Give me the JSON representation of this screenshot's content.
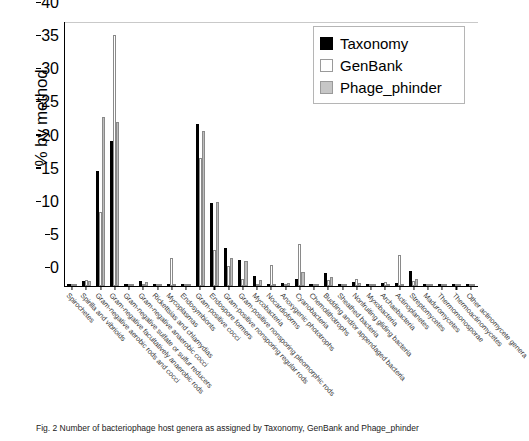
{
  "chart_data": {
    "type": "bar",
    "title": "",
    "xlabel": "",
    "ylabel": "% by method",
    "ylim": [
      0,
      40
    ],
    "yticks": [
      0,
      5,
      10,
      15,
      20,
      25,
      30,
      35,
      40
    ],
    "grid": false,
    "legend_position": "top-right",
    "colors": {
      "taxonomy": "#000000",
      "genbank": "#ffffff",
      "phage_phinder": "#bdbdbd"
    },
    "categories": [
      "Spirochetes",
      "Spirilla and vibrioids",
      "Gram-negative aerobic rods and cocci",
      "Gram-negative facultatively anaerobic rods",
      "Gram-negative sulfate or sulfur reducers",
      "Gram-negative anaerobic cocci",
      "Rickettsias and chlamydias",
      "Mycoplasmas",
      "Endosymbionts",
      "Gram-positive cocci",
      "Endospore formers",
      "Gram-positive nonsporing regular rods",
      "Gram-positive nonsporing pleomorphic rods",
      "Mycobacteria",
      "Nocardioforms",
      "Anoxygenic phototrophs",
      "Cyanobacteria",
      "Chemolithotrophs",
      "Budding and/or appendaged bacteria",
      "Sheathed bacteria",
      "Nonfruiting gliding bacteria",
      "Myxobacteria",
      "Archaebacteria",
      "Actinoplanetes",
      "Streptomycetes",
      "Maduromycetes",
      "Thermomonosporae",
      "Thermoactinomycetes",
      "Other actinomycete genera"
    ],
    "series": [
      {
        "name": "Taxonomy",
        "values": [
          0.3,
          0.8,
          17.4,
          21.9,
          0.0,
          0.8,
          0.1,
          0.0,
          0.0,
          24.5,
          12.5,
          5.7,
          3.9,
          1.5,
          0.0,
          0.5,
          1.1,
          0.2,
          1.9,
          0.0,
          0.6,
          0.0,
          0.5,
          0.4,
          2.2,
          0.0,
          0.2,
          0.0,
          0.2
        ],
        "color": "#000000"
      },
      {
        "name": "GenBank",
        "values": [
          0.2,
          0.9,
          11.2,
          37.9,
          0.1,
          0.0,
          0.0,
          4.2,
          0.2,
          19.3,
          5.5,
          3.0,
          1.1,
          0.3,
          3.2,
          0.1,
          6.4,
          0.0,
          0.9,
          0.0,
          1.0,
          0.1,
          0.6,
          4.7,
          0.7,
          0.0,
          0.3,
          0.0,
          0.2
        ],
        "color": "#ffffff"
      },
      {
        "name": "Phage_phinder",
        "values": [
          0.3,
          0.7,
          25.5,
          24.8,
          0.1,
          0.6,
          0.1,
          0.0,
          0.1,
          23.4,
          12.7,
          4.2,
          3.8,
          0.9,
          0.2,
          0.4,
          2.1,
          0.1,
          1.3,
          0.0,
          0.5,
          0.0,
          0.3,
          0.2,
          1.0,
          0.0,
          0.2,
          0.0,
          0.3
        ],
        "color": "#bdbdbd"
      }
    ]
  },
  "legend": {
    "items": [
      {
        "label": "Taxonomy",
        "swatch": "black-square-swatch"
      },
      {
        "label": "GenBank",
        "swatch": "white-square-swatch"
      },
      {
        "label": "Phage_phinder",
        "swatch": "gray-square-swatch"
      }
    ]
  },
  "caption": {
    "text": "Fig. 2  Number of bacteriophage host genera as assigned by Taxonomy, GenBank and Phage_phinder"
  }
}
